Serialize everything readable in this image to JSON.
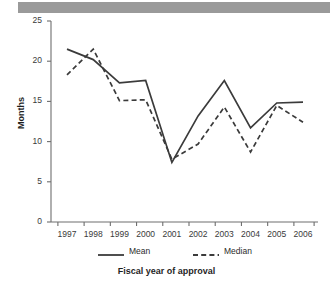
{
  "chart_data": {
    "type": "line",
    "title": "",
    "xlabel": "Fiscal year of approval",
    "ylabel": "Months",
    "categories": [
      "1997",
      "1998",
      "1999",
      "2000",
      "2001",
      "2002",
      "2003",
      "2004",
      "2005",
      "2006"
    ],
    "ylim": [
      0,
      25
    ],
    "yticks": [
      0,
      5,
      10,
      15,
      20,
      25
    ],
    "ytick_labels": [
      "0",
      "5",
      "10",
      "15",
      "20",
      "25"
    ],
    "grid": false,
    "legend_position": "below-axis",
    "series": [
      {
        "name": "Mean",
        "style": "solid",
        "color": "#3b3b3b",
        "values": [
          21.5,
          20.2,
          17.3,
          17.6,
          7.4,
          13.2,
          17.6,
          11.7,
          14.8,
          14.9
        ]
      },
      {
        "name": "Median",
        "style": "dashed",
        "color": "#3b3b3b",
        "values": [
          18.3,
          21.5,
          15.1,
          15.2,
          7.8,
          9.7,
          14.3,
          8.7,
          14.5,
          12.4
        ]
      }
    ]
  },
  "decor": {
    "top_rule_color": "#9a9a9a"
  },
  "axis": {
    "axis_color": "#6e6e6e"
  }
}
